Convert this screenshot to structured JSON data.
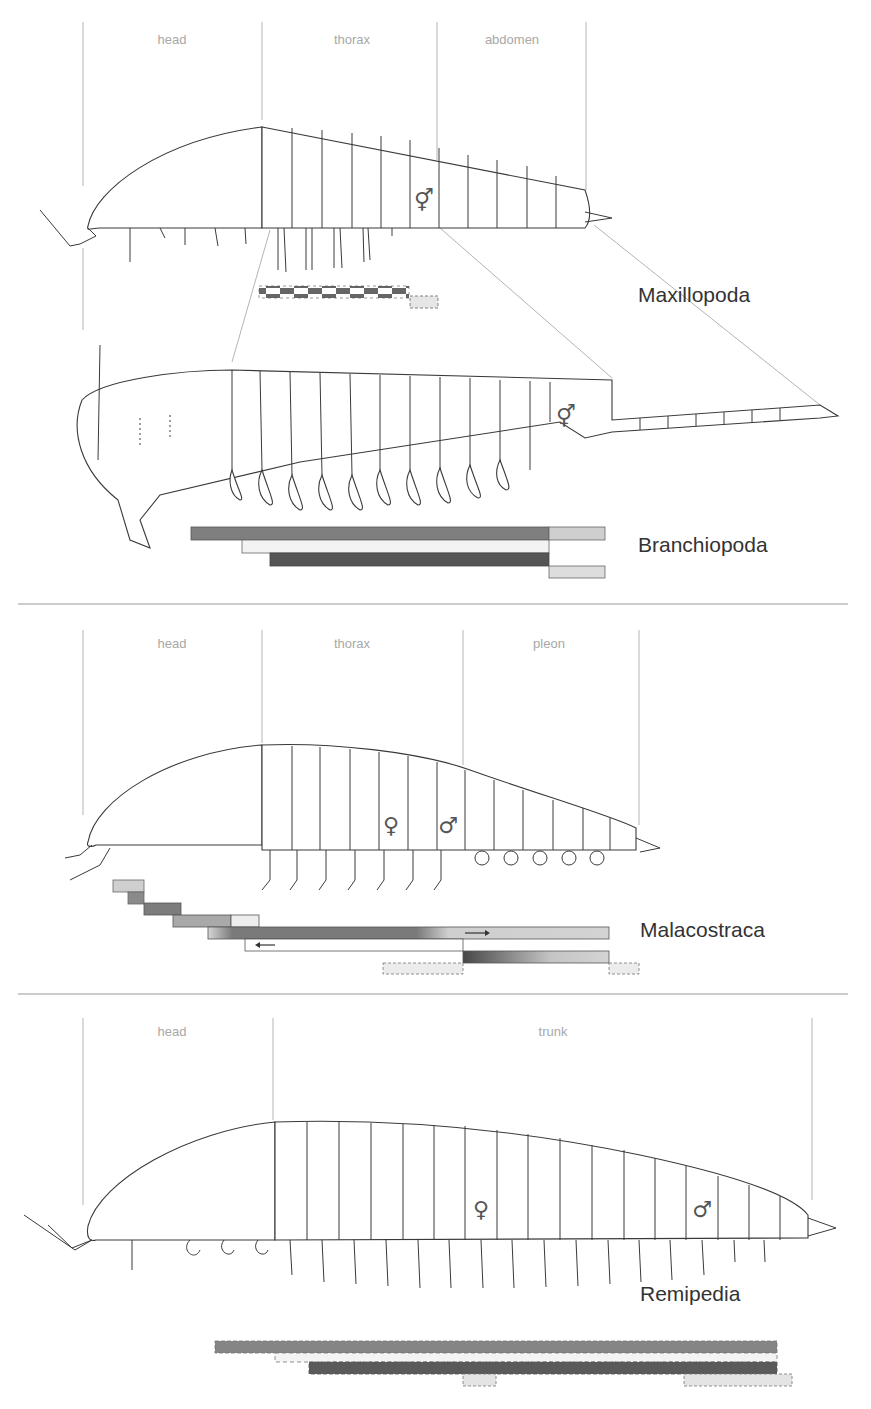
{
  "figure": {
    "width": 871,
    "height": 1409,
    "dividers_y": [
      604,
      994
    ],
    "colors": {
      "dark": "#555555",
      "mid": "#878787",
      "light": "#c9c9c9",
      "pale": "#e8e8e8",
      "outline": "#3a3a3a",
      "guide": "#b4b4b4",
      "label": "#a8a8a8"
    }
  },
  "panels": [
    {
      "id": "maxillopoda",
      "taxon": "Maxillopoda",
      "taxon_pos": [
        638,
        302
      ],
      "regions": [
        {
          "label": "head",
          "x": 172,
          "y": 44
        },
        {
          "label": "thorax",
          "x": 352,
          "y": 44
        },
        {
          "label": "abdomen",
          "x": 512,
          "y": 44
        }
      ],
      "guides_x": [
        83,
        262,
        437,
        586
      ],
      "guides_y": [
        22,
        186
      ],
      "sex_symbols": [
        {
          "symbol": "⚥",
          "x": 424,
          "y": 208
        }
      ],
      "bars": [
        {
          "x": 259,
          "y": 286,
          "w": 150,
          "h": 6,
          "style": "checker-top"
        },
        {
          "x": 259,
          "y": 292,
          "w": 150,
          "h": 6,
          "style": "checker-bottom"
        },
        {
          "x": 410,
          "y": 296,
          "w": 28,
          "h": 12,
          "style": "dashed-light"
        }
      ]
    },
    {
      "id": "branchiopoda",
      "taxon": "Branchiopoda",
      "taxon_pos": [
        638,
        552
      ],
      "regions": [],
      "guides_x": [],
      "sex_symbols": [
        {
          "symbol": "⚥",
          "x": 566,
          "y": 424
        }
      ],
      "bars": [
        {
          "x": 191,
          "y": 527,
          "w": 358,
          "h": 13,
          "style": "mid"
        },
        {
          "x": 549,
          "y": 527,
          "w": 56,
          "h": 13,
          "style": "light"
        },
        {
          "x": 242,
          "y": 540,
          "w": 307,
          "h": 13,
          "style": "pale"
        },
        {
          "x": 270,
          "y": 553,
          "w": 279,
          "h": 13,
          "style": "dark"
        },
        {
          "x": 549,
          "y": 566,
          "w": 56,
          "h": 12,
          "style": "light"
        }
      ]
    },
    {
      "id": "malacostraca",
      "taxon": "Malacostraca",
      "taxon_pos": [
        640,
        937
      ],
      "regions": [
        {
          "label": "head",
          "x": 172,
          "y": 648
        },
        {
          "label": "thorax",
          "x": 352,
          "y": 648
        },
        {
          "label": "pleon",
          "x": 549,
          "y": 648
        }
      ],
      "guides_x": [
        83,
        262,
        463,
        639
      ],
      "guides_y": [
        630,
        850
      ],
      "sex_symbols": [
        {
          "symbol": "♀",
          "x": 391,
          "y": 833
        },
        {
          "symbol": "♂",
          "x": 448,
          "y": 833
        }
      ],
      "bars": [
        {
          "x": 113,
          "y": 880,
          "w": 31,
          "h": 12,
          "style": "light"
        },
        {
          "x": 128,
          "y": 892,
          "w": 16,
          "h": 12,
          "style": "mid"
        },
        {
          "x": 144,
          "y": 903,
          "w": 37,
          "h": 12,
          "style": "mid"
        },
        {
          "x": 173,
          "y": 915,
          "w": 58,
          "h": 12,
          "style": "light-mid"
        },
        {
          "x": 231,
          "y": 915,
          "w": 28,
          "h": 12,
          "style": "pale"
        },
        {
          "x": 208,
          "y": 927,
          "w": 401,
          "h": 12,
          "style": "gradient-mid"
        },
        {
          "x": 245,
          "y": 939,
          "w": 218,
          "h": 12,
          "style": "white"
        },
        {
          "x": 463,
          "y": 951,
          "w": 146,
          "h": 12,
          "style": "gradient-dark"
        },
        {
          "x": 383,
          "y": 963,
          "w": 80,
          "h": 11,
          "style": "dashed-light"
        },
        {
          "x": 609,
          "y": 963,
          "w": 30,
          "h": 11,
          "style": "dashed-light"
        }
      ],
      "arrows": [
        {
          "direction": "right",
          "x": 475,
          "y": 933
        },
        {
          "direction": "left",
          "x": 262,
          "y": 945
        }
      ]
    },
    {
      "id": "remipedia",
      "taxon": "Remipedia",
      "taxon_pos": [
        640,
        1301
      ],
      "regions": [
        {
          "label": "head",
          "x": 172,
          "y": 1036
        },
        {
          "label": "trunk",
          "x": 553,
          "y": 1036
        }
      ],
      "guides_x": [
        83,
        273,
        812
      ],
      "guides_y": [
        1018,
        1222
      ],
      "sex_symbols": [
        {
          "symbol": "♀",
          "x": 481,
          "y": 1217
        },
        {
          "symbol": "♂",
          "x": 702,
          "y": 1217
        }
      ],
      "bars": [
        {
          "x": 215,
          "y": 1341,
          "w": 562,
          "h": 12,
          "style": "mid-dashed"
        },
        {
          "x": 275,
          "y": 1353,
          "w": 502,
          "h": 9,
          "style": "pale-dashed"
        },
        {
          "x": 309,
          "y": 1362,
          "w": 468,
          "h": 12,
          "style": "dark-dashed"
        },
        {
          "x": 463,
          "y": 1374,
          "w": 33,
          "h": 12,
          "style": "dashed-light"
        },
        {
          "x": 684,
          "y": 1374,
          "w": 108,
          "h": 12,
          "style": "dashed-light"
        }
      ]
    }
  ]
}
